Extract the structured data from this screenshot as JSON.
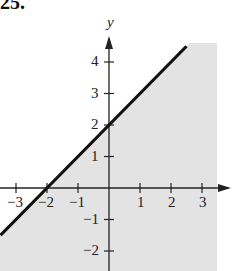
{
  "problem_number": "25.",
  "chart_data": {
    "type": "line",
    "title": "",
    "xlabel": "",
    "ylabel": "y",
    "xlim": [
      -3.5,
      3.6
    ],
    "ylim": [
      -2.6,
      4.7
    ],
    "grid": false,
    "x_ticks": [
      -3,
      -2,
      -1,
      1,
      2,
      3
    ],
    "y_ticks": [
      -2,
      -1,
      1,
      2,
      3,
      4
    ],
    "x_tick_labels": [
      "−3",
      "−2",
      "−1",
      "1",
      "2",
      "3"
    ],
    "y_tick_labels": [
      "−2",
      "−1",
      "1",
      "2",
      "3",
      "4"
    ],
    "series": [
      {
        "name": "boundary line y = x + 2",
        "style": "solid",
        "x": [
          -3.5,
          -2,
          0,
          2.5
        ],
        "y": [
          -1.5,
          0,
          2,
          4.5
        ]
      }
    ],
    "shaded_region": {
      "description": "region below/right of the line (y <= x + 2)",
      "fill": "#e3e3e3"
    },
    "annotations": [
      {
        "text": "x-intercept",
        "x": -2,
        "y": 0
      },
      {
        "text": "y-intercept",
        "x": 0,
        "y": 2
      }
    ]
  },
  "colors": {
    "shade": "#e3e3e3",
    "line": "#111111",
    "axis": "#222222"
  }
}
